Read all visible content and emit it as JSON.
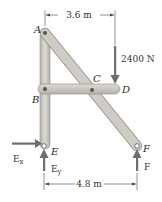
{
  "diagram": {
    "type": "frame-structure",
    "points": {
      "A": {
        "label": "A"
      },
      "B": {
        "label": "B"
      },
      "C": {
        "label": "C"
      },
      "D": {
        "label": "D"
      },
      "E": {
        "label": "E"
      },
      "F": {
        "label": "F"
      }
    },
    "dimensions": {
      "top": "3.6 m",
      "bottom": "4.8 m"
    },
    "loads": {
      "applied": "2400 N"
    },
    "reactions": {
      "Ex": {
        "main": "E",
        "sub": "x"
      },
      "Ey": {
        "main": "E",
        "sub": "y"
      },
      "F": "F"
    },
    "colors": {
      "member_fill": "#c9c6c0",
      "member_edge": "#8f8b85",
      "arrow": "#6e6e6e",
      "text": "#2a2a2a"
    }
  }
}
